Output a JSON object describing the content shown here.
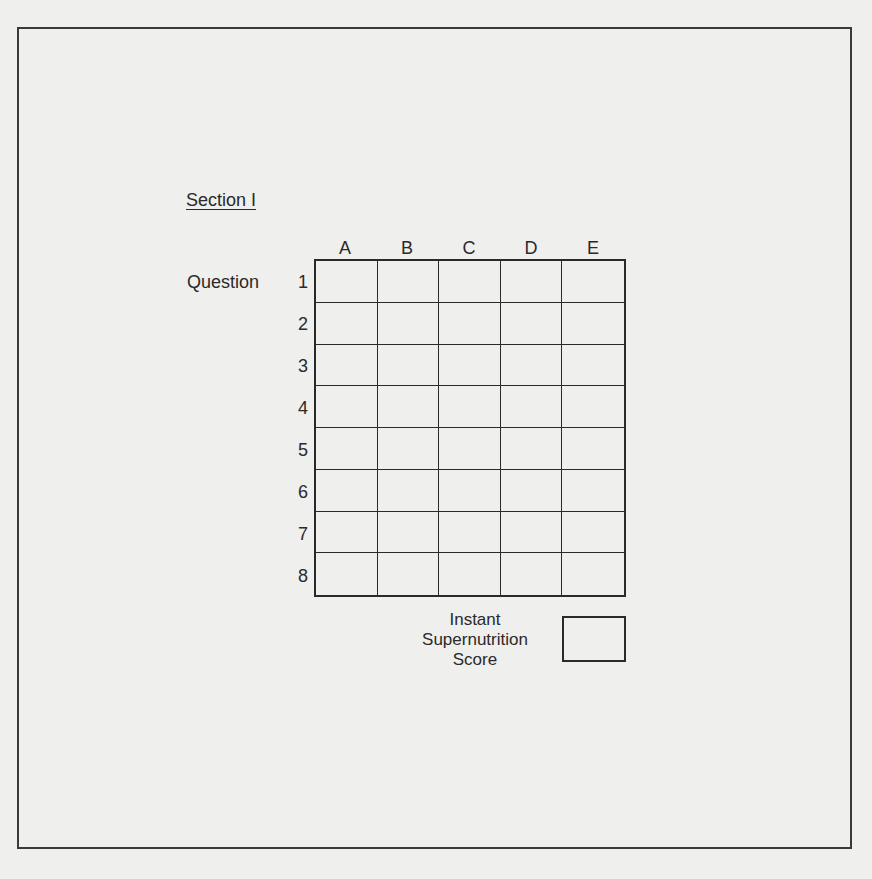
{
  "section": {
    "title": "Section I"
  },
  "grid": {
    "row_header": "Question",
    "columns": [
      "A",
      "B",
      "C",
      "D",
      "E"
    ],
    "rows": [
      "1",
      "2",
      "3",
      "4",
      "5",
      "6",
      "7",
      "8"
    ]
  },
  "score": {
    "label_lines": [
      "Instant",
      "Supernutrition",
      "Score"
    ],
    "value": ""
  }
}
